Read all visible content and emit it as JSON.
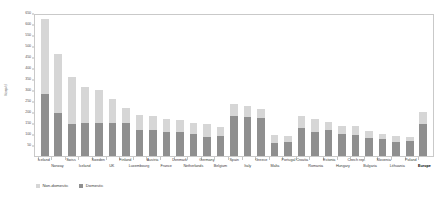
{
  "chart_data": {
    "type": "bar",
    "subtype": "stacked-bar",
    "title": "",
    "xlabel": "",
    "ylabel": "l/cap/d",
    "ylim": [
      0,
      650
    ],
    "yticks": [
      0,
      50,
      100,
      150,
      200,
      250,
      300,
      350,
      400,
      450,
      500,
      550,
      600,
      650
    ],
    "ytick_labels": [
      "0",
      "50",
      "100",
      "150",
      "200",
      "250",
      "300",
      "350",
      "400",
      "450",
      "500",
      "550",
      "600",
      "650"
    ],
    "grid": false,
    "legend_position": "bottom-left",
    "categories": [
      "Iceland",
      "Norway",
      "Swiss",
      "Iceland",
      "Sweden",
      "UK",
      "Finland",
      "Luxembourg",
      "Austria",
      "France",
      "Denmark",
      "Netherlands",
      "Germany",
      "Belgium",
      "Spain",
      "Italy",
      "Greece",
      "Malta",
      "Portugal",
      "Croatia",
      "Romania",
      "Estonia",
      "Hungary",
      "Czech rep.",
      "Bulgaria",
      "Slovenia",
      "Lithuania",
      "Poland",
      "Europe"
    ],
    "label_rows": [
      0,
      1,
      0,
      1,
      0,
      1,
      0,
      1,
      0,
      1,
      0,
      1,
      0,
      1,
      0,
      1,
      0,
      1,
      0,
      0,
      1,
      0,
      1,
      0,
      1,
      0,
      1,
      0,
      1
    ],
    "bold_categories": [
      "Europe"
    ],
    "series": [
      {
        "name": "Domestic",
        "color": "#8f8f8f",
        "values": [
          280,
          195,
          145,
          150,
          148,
          150,
          148,
          120,
          118,
          110,
          108,
          102,
          88,
          92,
          180,
          178,
          172,
          60,
          62,
          128,
          110,
          118,
          100,
          95,
          80,
          78,
          62,
          70,
          145
        ]
      },
      {
        "name": "Non-domestic",
        "color": "#d6d6d6",
        "values": [
          345,
          270,
          215,
          163,
          152,
          108,
          72,
          68,
          62,
          58,
          57,
          50,
          58,
          40,
          55,
          48,
          40,
          35,
          30,
          55,
          58,
          35,
          38,
          40,
          35,
          22,
          28,
          18,
          55
        ]
      }
    ],
    "totals": [
      625,
      465,
      360,
      313,
      300,
      258,
      220,
      188,
      180,
      168,
      165,
      152,
      146,
      132,
      235,
      226,
      212,
      95,
      92,
      183,
      168,
      153,
      138,
      135,
      115,
      100,
      90,
      88,
      200
    ]
  },
  "legend": {
    "items": [
      {
        "label": "Non-domestic",
        "color": "#d6d6d6",
        "name": "legend-non-domestic"
      },
      {
        "label": "Domestic",
        "color": "#8f8f8f",
        "name": "legend-domestic"
      }
    ]
  },
  "axis": {
    "y_title": "l/cap/d"
  }
}
